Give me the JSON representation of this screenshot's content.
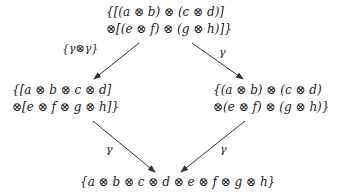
{
  "diagram": {
    "type": "commutative-diagram",
    "nodes": {
      "top": {
        "lines": [
          "{[(a ⊗ b) ⊗ (c ⊗ d)]",
          "⊗[(e ⊗ f) ⊗ (g ⊗ h)]}"
        ]
      },
      "left": {
        "lines": [
          "{[a ⊗ b ⊗ c ⊗ d]",
          "⊗[e ⊗ f ⊗ g ⊗ h]}"
        ]
      },
      "right": {
        "lines": [
          "{(a ⊗ b) ⊗ (c ⊗ d)",
          "⊗(e ⊗ f) ⊗ (g ⊗ h)}"
        ]
      },
      "bottom": {
        "lines": [
          "{a ⊗ b ⊗ c ⊗ d ⊗ e ⊗ f ⊗ g ⊗ h}"
        ]
      }
    },
    "edges": [
      {
        "from": "top",
        "to": "left",
        "label": "{γ⊗γ}"
      },
      {
        "from": "top",
        "to": "right",
        "label": "γ"
      },
      {
        "from": "left",
        "to": "bottom",
        "label": "γ"
      },
      {
        "from": "right",
        "to": "bottom",
        "label": "γ"
      }
    ],
    "colors": {
      "stroke": "#333333",
      "text": "#1a1a1a",
      "background": "#ffffff"
    }
  }
}
